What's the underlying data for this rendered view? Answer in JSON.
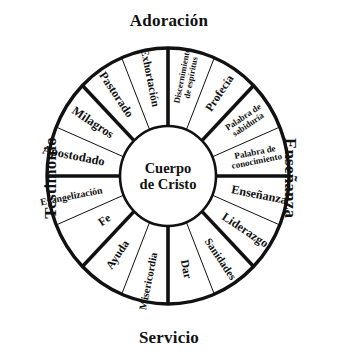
{
  "diagram": {
    "title_center": {
      "line1": "Cuerpo",
      "line2": "de Cristo"
    },
    "quadrant_labels": {
      "top": "Adoración",
      "right": "Enseñanza",
      "bottom": "Servicio",
      "left": "Testimonio"
    },
    "colors": {
      "stroke": "#111111",
      "fill": "#ffffff",
      "text": "#111111"
    },
    "geometry": {
      "center_x": 168,
      "center_y": 176,
      "outer_radius_x": 121,
      "outer_radius_y": 128,
      "hub_radius_x": 48,
      "hub_radius_y": 50,
      "sector_count": 16,
      "sector_span_degrees": 22.5
    },
    "sectors": [
      {
        "label": "Discernimiento de espíritus",
        "lines": [
          "Discernimiento",
          "de espíritus"
        ],
        "quadrant": "Adoración",
        "index": 0,
        "font_size": 8.6,
        "radius": 98,
        "flip": false
      },
      {
        "label": "Profecía",
        "lines": [
          "Profecía"
        ],
        "quadrant": "Adoración",
        "index": 1,
        "font_size": 11.6,
        "radius": 96,
        "flip": false
      },
      {
        "label": "Palabra de sabiduría",
        "lines": [
          "Palabra de",
          "sabiduría"
        ],
        "quadrant": "Enseñanza",
        "index": 2,
        "font_size": 8.8,
        "radius": 96,
        "flip": false
      },
      {
        "label": "Palabra de conocimiento",
        "lines": [
          "Palabra de",
          "conocimiento"
        ],
        "quadrant": "Enseñanza",
        "index": 3,
        "font_size": 9.0,
        "radius": 92,
        "flip": false
      },
      {
        "label": "Enseñanza",
        "lines": [
          "Enseñanza"
        ],
        "quadrant": "Enseñanza",
        "index": 4,
        "font_size": 12.2,
        "radius": 95,
        "flip": false
      },
      {
        "label": "Liderazgo",
        "lines": [
          "Liderazgo"
        ],
        "quadrant": "Enseñanza",
        "index": 5,
        "font_size": 12.2,
        "radius": 95,
        "flip": false
      },
      {
        "label": "Sanidades",
        "lines": [
          "Sanidades"
        ],
        "quadrant": "Servicio",
        "index": 6,
        "font_size": 11.0,
        "radius": 97,
        "flip": false
      },
      {
        "label": "Dar",
        "lines": [
          "Dar"
        ],
        "quadrant": "Servicio",
        "index": 7,
        "font_size": 11.6,
        "radius": 92,
        "flip": false
      },
      {
        "label": "Misericordia",
        "lines": [
          "Misericordia"
        ],
        "quadrant": "Servicio",
        "index": 8,
        "font_size": 10.6,
        "radius": 104,
        "flip": true
      },
      {
        "label": "Ayuda",
        "lines": [
          "Ayuda"
        ],
        "quadrant": "Servicio",
        "index": 9,
        "font_size": 11.6,
        "radius": 92,
        "flip": true
      },
      {
        "label": "Fe",
        "lines": [
          "Fe"
        ],
        "quadrant": "Testimonio",
        "index": 10,
        "font_size": 11.6,
        "radius": 78,
        "flip": true
      },
      {
        "label": "Evangelización",
        "lines": [
          "Evangelización"
        ],
        "quadrant": "Testimonio",
        "index": 11,
        "font_size": 9.8,
        "radius": 101,
        "flip": true
      },
      {
        "label": "Apostodado",
        "lines": [
          "Apostodado"
        ],
        "quadrant": "Testimonio",
        "index": 12,
        "font_size": 12.4,
        "radius": 99,
        "flip": true
      },
      {
        "label": "Milagros",
        "lines": [
          "Milagros"
        ],
        "quadrant": "Testimonio",
        "index": 13,
        "font_size": 12.4,
        "radius": 93,
        "flip": true
      },
      {
        "label": "Pastorado",
        "lines": [
          "Pastorado"
        ],
        "quadrant": "Adoración",
        "index": 14,
        "font_size": 12.0,
        "radius": 95,
        "flip": true
      },
      {
        "label": "Exhortación",
        "lines": [
          "Exhortación"
        ],
        "quadrant": "Adoración",
        "index": 15,
        "font_size": 11.2,
        "radius": 97,
        "flip": true
      }
    ],
    "thick_dividers_degrees": [
      0,
      90,
      180,
      270,
      45,
      135,
      225,
      315
    ]
  }
}
